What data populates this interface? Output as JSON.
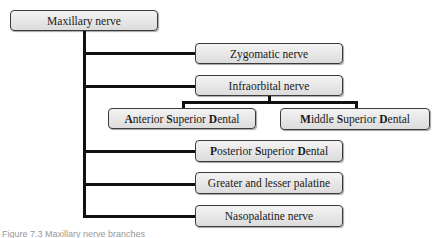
{
  "diagram": {
    "root": {
      "label": "Maxillary nerve"
    },
    "branches": [
      {
        "label": "Zygomatic nerve"
      },
      {
        "label": "Infraorbital nerve",
        "children": [
          {
            "label_parts": [
              [
                "A",
                "nterior "
              ],
              [
                "S",
                "uperior "
              ],
              [
                "D",
                "ental"
              ]
            ]
          },
          {
            "label_parts": [
              [
                "M",
                "iddle "
              ],
              [
                "S",
                "uperior "
              ],
              [
                "D",
                "ental"
              ]
            ]
          }
        ]
      },
      {
        "label_parts": [
          [
            "P",
            "osterior "
          ],
          [
            "S",
            "uperior "
          ],
          [
            "D",
            "ental"
          ]
        ]
      },
      {
        "label": "Greater and lesser palatine"
      },
      {
        "label": "Nasopalatine nerve"
      }
    ]
  },
  "caption": "Figure 7.3  Maxillary nerve branches"
}
